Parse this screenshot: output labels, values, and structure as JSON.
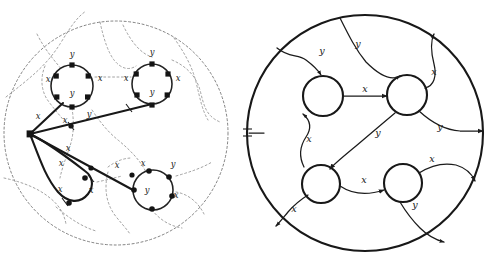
{
  "figure": {
    "panels": [
      {
        "id": "left-panel",
        "name": "left-embedding-diagram",
        "boundary_style": "dotted",
        "description": "Dotted disc boundary with dotted dual curves; solid graph of four cycles joined to a central branch vertex",
        "vertices": [
          {
            "id": "hub",
            "shape": "square",
            "cx": 30,
            "cy": 134
          },
          {
            "id": "c1-top",
            "shape": "square",
            "cx": 72,
            "cy": 65
          },
          {
            "id": "c1-left",
            "shape": "square",
            "cx": 56,
            "cy": 76
          },
          {
            "id": "c1-right",
            "shape": "square",
            "cx": 89,
            "cy": 76
          },
          {
            "id": "c1-bl",
            "shape": "square",
            "cx": 57,
            "cy": 97
          },
          {
            "id": "c1-br",
            "shape": "square",
            "cx": 88,
            "cy": 97
          },
          {
            "id": "c1-bot",
            "shape": "square",
            "cx": 72,
            "cy": 107
          },
          {
            "id": "c2-top",
            "shape": "square",
            "cx": 152,
            "cy": 63
          },
          {
            "id": "c2-left",
            "shape": "square",
            "cx": 136,
            "cy": 74
          },
          {
            "id": "c2-right",
            "shape": "square",
            "cx": 168,
            "cy": 74
          },
          {
            "id": "c2-bl",
            "shape": "square",
            "cx": 137,
            "cy": 95
          },
          {
            "id": "c2-br",
            "shape": "square",
            "cx": 167,
            "cy": 95
          },
          {
            "id": "c2-bot",
            "shape": "square",
            "cx": 152,
            "cy": 105
          },
          {
            "id": "mid-a",
            "shape": "dot",
            "cx": 71,
            "cy": 126
          },
          {
            "id": "mid-b",
            "shape": "dot",
            "cx": 91,
            "cy": 168
          },
          {
            "id": "mid-c",
            "shape": "dot",
            "cx": 132,
            "cy": 175
          },
          {
            "id": "loop-r",
            "shape": "dot",
            "cx": 85,
            "cy": 178
          },
          {
            "id": "loop-b",
            "shape": "dot",
            "cx": 69,
            "cy": 203
          },
          {
            "id": "c3-l",
            "shape": "dot",
            "cx": 134,
            "cy": 190
          },
          {
            "id": "c3-tl",
            "shape": "dot",
            "cx": 149,
            "cy": 172
          },
          {
            "id": "c3-tr",
            "shape": "dot",
            "cx": 170,
            "cy": 178
          },
          {
            "id": "c3-r",
            "shape": "dot",
            "cx": 173,
            "cy": 195
          },
          {
            "id": "c3-b",
            "shape": "dot",
            "cx": 152,
            "cy": 208
          }
        ],
        "labels": [
          {
            "text": "y",
            "x": 72,
            "y": 54,
            "group": "circle-top-left"
          },
          {
            "text": "x",
            "x": 48,
            "y": 79,
            "group": "circle-top-left"
          },
          {
            "text": "x",
            "x": 100,
            "y": 78,
            "group": "circle-top-left"
          },
          {
            "text": "y",
            "x": 72,
            "y": 93,
            "group": "circle-top-left"
          },
          {
            "text": "y",
            "x": 152,
            "y": 52,
            "group": "circle-top-right"
          },
          {
            "text": "x",
            "x": 126,
            "y": 78,
            "group": "circle-top-right"
          },
          {
            "text": "x",
            "x": 178,
            "y": 78,
            "group": "circle-top-right"
          },
          {
            "text": "y",
            "x": 152,
            "y": 92,
            "group": "circle-top-right"
          },
          {
            "text": "x",
            "x": 38,
            "y": 116,
            "group": "hub-edges"
          },
          {
            "text": "x",
            "x": 65,
            "y": 120,
            "group": "hub-edges"
          },
          {
            "text": "y",
            "x": 89,
            "y": 114,
            "group": "hub-edges"
          },
          {
            "text": "x",
            "x": 68,
            "y": 148,
            "group": "hub-edges"
          },
          {
            "text": "x",
            "x": 61,
            "y": 163,
            "group": "loop"
          },
          {
            "text": "x",
            "x": 60,
            "y": 189,
            "group": "loop"
          },
          {
            "text": "x",
            "x": 91,
            "y": 190,
            "group": "loop"
          },
          {
            "text": "x",
            "x": 117,
            "y": 165,
            "group": "lower-edge"
          },
          {
            "text": "x",
            "x": 143,
            "y": 163,
            "group": "circle-bottom-right"
          },
          {
            "text": "y",
            "x": 173,
            "y": 164,
            "group": "circle-bottom-right"
          },
          {
            "text": "y",
            "x": 147,
            "y": 190,
            "group": "circle-bottom-right"
          },
          {
            "text": "x",
            "x": 176,
            "y": 195,
            "group": "circle-bottom-right"
          }
        ]
      },
      {
        "id": "right-panel",
        "name": "right-embedding-diagram",
        "boundary_style": "solid",
        "description": "Solid disc boundary with a basepoint tick on the left; four open circular vertices joined by labelled directed arcs",
        "basepoint": {
          "x": 247,
          "y": 133,
          "marker": "cross-tick"
        },
        "nodes": [
          {
            "id": "n-tl",
            "cx": 323,
            "cy": 96,
            "r": 20
          },
          {
            "id": "n-tr",
            "cx": 407,
            "cy": 95,
            "r": 20
          },
          {
            "id": "n-bl",
            "cx": 321,
            "cy": 184,
            "r": 19
          },
          {
            "id": "n-br",
            "cx": 403,
            "cy": 183,
            "r": 19
          }
        ],
        "labels": [
          {
            "text": "y",
            "x": 322,
            "y": 51,
            "group": "top-arcs"
          },
          {
            "text": "y",
            "x": 358,
            "y": 44,
            "group": "top-arcs"
          },
          {
            "text": "x",
            "x": 365,
            "y": 89,
            "group": "middle-arc"
          },
          {
            "text": "x",
            "x": 434,
            "y": 72,
            "group": "right-arcs"
          },
          {
            "text": "y",
            "x": 440,
            "y": 127,
            "group": "right-arcs"
          },
          {
            "text": "x",
            "x": 309,
            "y": 139,
            "group": "left-arcs"
          },
          {
            "text": "y",
            "x": 378,
            "y": 133,
            "group": "diagonal-arc"
          },
          {
            "text": "x",
            "x": 432,
            "y": 159,
            "group": "right-arcs"
          },
          {
            "text": "x",
            "x": 364,
            "y": 180,
            "group": "bottom-arc"
          },
          {
            "text": "x",
            "x": 294,
            "y": 209,
            "group": "bottom-left-arc"
          },
          {
            "text": "y",
            "x": 415,
            "y": 205,
            "group": "bottom-right-arc"
          }
        ]
      }
    ],
    "alphabet": {
      "generator_x": "x",
      "generator_y": "y"
    },
    "colors": {
      "ink": "#1b1b1b",
      "dotted": "#6d6d6d",
      "background": "#ffffff"
    }
  }
}
